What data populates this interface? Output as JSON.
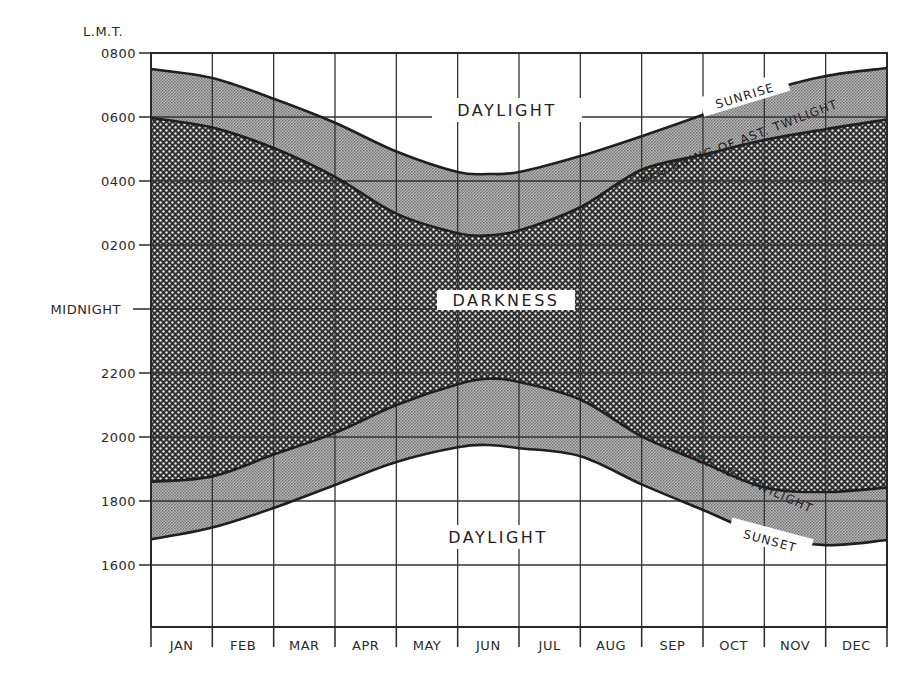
{
  "chart_data": {
    "type": "area",
    "title": "",
    "ylabel": "L.M.T.",
    "xlabel": "",
    "categories": [
      "JAN",
      "FEB",
      "MAR",
      "APR",
      "MAY",
      "JUN",
      "JUL",
      "AUG",
      "SEP",
      "OCT",
      "NOV",
      "DEC"
    ],
    "y_axis": {
      "unit": "hours from 1400 (L.M.T.)",
      "range_hours": [
        14.0,
        32.0
      ],
      "ticks": [
        {
          "label": "0800",
          "hour": 32
        },
        {
          "label": "0600",
          "hour": 30
        },
        {
          "label": "0400",
          "hour": 28
        },
        {
          "label": "0200",
          "hour": 26
        },
        {
          "label": "MIDNIGHT",
          "hour": 24
        },
        {
          "label": "2200",
          "hour": 22
        },
        {
          "label": "2000",
          "hour": 20
        },
        {
          "label": "1800",
          "hour": 18
        },
        {
          "label": "1600",
          "hour": 16
        }
      ]
    },
    "x_axis": {
      "unit": "month (0 = start of Jan, 12 = end of Dec)",
      "range": [
        0,
        12
      ]
    },
    "grid": true,
    "x": [
      0,
      1,
      2,
      3,
      4,
      5,
      5.5,
      6,
      7,
      8,
      9,
      10,
      11,
      12
    ],
    "series": [
      {
        "name": "Sunrise",
        "hours": [
          31.5,
          31.22,
          30.57,
          29.82,
          28.92,
          28.28,
          28.22,
          28.28,
          28.78,
          29.4,
          30.07,
          30.78,
          31.28,
          31.53
        ]
      },
      {
        "name": "Beginning of Ast. Twilight",
        "hours": [
          29.97,
          29.67,
          29.03,
          28.13,
          26.98,
          26.37,
          26.3,
          26.45,
          27.18,
          28.35,
          28.82,
          29.28,
          29.62,
          29.92
        ]
      },
      {
        "name": "End of Ast. Twilight",
        "hours": [
          18.6,
          18.77,
          19.45,
          20.13,
          21.0,
          21.65,
          21.82,
          21.72,
          21.17,
          20.02,
          19.2,
          18.42,
          18.28,
          18.42
        ]
      },
      {
        "name": "Sunset",
        "hours": [
          16.8,
          17.17,
          17.78,
          18.5,
          19.22,
          19.68,
          19.75,
          19.65,
          19.4,
          18.52,
          17.72,
          16.93,
          16.62,
          16.78
        ]
      }
    ],
    "annotations": {
      "daylight_top": "DAYLIGHT",
      "darkness": "DARKNESS",
      "daylight_bottom": "DAYLIGHT",
      "sunrise": "SUNRISE",
      "begin_twilight": "BEGINNING OF AST. TWILIGHT",
      "end_twilight": "END OF AST. TWILIGHT",
      "sunset": "SUNSET"
    },
    "fills": {
      "daylight": "#ffffff",
      "twilight": "#9c9c9c",
      "darkness": "#3a3a3a"
    },
    "legend": "none"
  }
}
